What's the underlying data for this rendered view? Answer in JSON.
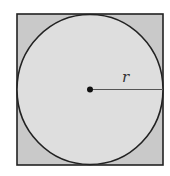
{
  "diagram": {
    "radius_label": "r",
    "colors": {
      "background": "#ffffff",
      "square_fill": "#c9c9c9",
      "circle_fill": "#dedede",
      "stroke": "#222222"
    }
  }
}
